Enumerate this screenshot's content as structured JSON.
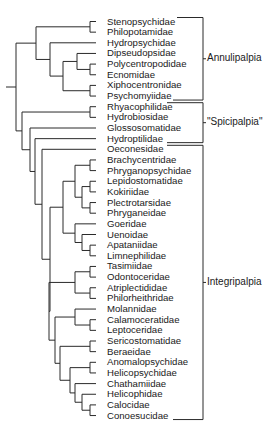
{
  "diagram": {
    "type": "phylogenetic-tree",
    "taxa": [
      "Stenopsychidae",
      "Philopotamidae",
      "Hydropsychidae",
      "Dipseudopsidae",
      "Polycentropodidae",
      "Ecnomidae",
      "Xiphocentronidae",
      "Psychomyiidae",
      "Rhyacophilidae",
      "Hydrobiosidae",
      "Glossosomatidae",
      "Hydroptilidae",
      "Oeconesidae",
      "Brachycentridae",
      "Phryganopsychidae",
      "Lepidostomatidae",
      "Kokiriidae",
      "Plectrotarsidae",
      "Phryganeidae",
      "Goeridae",
      "Uenoidae",
      "Apataniidae",
      "Limnephilidae",
      "Tasimiidae",
      "Odontoceridae",
      "Atriplectididae",
      "Philorheithridae",
      "Molannidae",
      "Calamoceratidae",
      "Leptoceridae",
      "Sericostomatidae",
      "Beraeidae",
      "Anomalopsychidae",
      "Helicopsychidae",
      "Chathamiidae",
      "Helicophidae",
      "Calocidae",
      "Conoesucidae"
    ],
    "groups": [
      {
        "name": "Annulipalpia",
        "from": "Stenopsychidae",
        "to": "Psychomyiidae"
      },
      {
        "name": "\"Spicipalpia\"",
        "from": "Rhyacophilidae",
        "to": "Hydroptilidae"
      },
      {
        "name": "Integripalpia",
        "from": "Oeconesidae",
        "to": "Conoesucidae"
      }
    ]
  },
  "caption_fragment": ""
}
